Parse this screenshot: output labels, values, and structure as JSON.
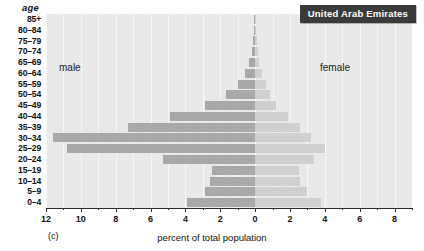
{
  "panel": {
    "letter": "(c)",
    "age_header": "age",
    "title": "United Arab Emirates",
    "male_caption": "male",
    "female_caption": "female"
  },
  "colors": {
    "male_bar": "#a8a8a8",
    "female_bar": "#cfcfcf",
    "plot_background": "#e9e9e9",
    "title_background": "#3a3a3a",
    "title_text": "#ffffff",
    "axis": "#2b2b2b"
  },
  "chart_data": {
    "type": "bar",
    "subtype": "population-pyramid",
    "title": "United Arab Emirates",
    "xlabel": "percent of total population",
    "ylabel": "age",
    "grid": true,
    "legend_position": "inline-labels",
    "xlim": [
      -12,
      9
    ],
    "x_axis_display": "absolute value (mirrored about 0)",
    "xticks": [
      12,
      10,
      8,
      6,
      4,
      2,
      0,
      2,
      4,
      6,
      8
    ],
    "xtick_labels": [
      "12",
      "10",
      "8",
      "6",
      "4",
      "2",
      "0",
      "2",
      "4",
      "6",
      "8"
    ],
    "xtick_minor_step": 1,
    "categories": [
      "85+",
      "80–84",
      "75–79",
      "70–74",
      "65–69",
      "60–64",
      "55–59",
      "50–54",
      "45–49",
      "40–44",
      "35–39",
      "30–34",
      "25–29",
      "20–24",
      "15–19",
      "10–14",
      "5–9",
      "0–4"
    ],
    "series": [
      {
        "name": "male",
        "side": "left",
        "color": "#a8a8a8",
        "values": [
          0.05,
          0.08,
          0.12,
          0.2,
          0.35,
          0.6,
          1.0,
          1.7,
          2.9,
          4.9,
          7.3,
          11.6,
          10.8,
          5.3,
          2.5,
          2.6,
          2.9,
          3.9
        ]
      },
      {
        "name": "female",
        "side": "right",
        "color": "#cfcfcf",
        "values": [
          0.04,
          0.06,
          0.1,
          0.15,
          0.25,
          0.4,
          0.6,
          0.85,
          1.2,
          1.9,
          2.6,
          3.2,
          4.0,
          3.4,
          2.5,
          2.6,
          3.0,
          3.8
        ]
      }
    ]
  }
}
